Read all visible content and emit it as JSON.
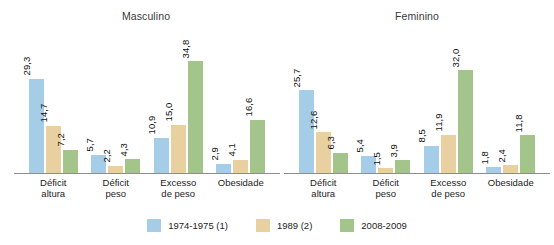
{
  "chart_data": {
    "type": "bar",
    "title": "",
    "xlabel": "",
    "ylabel": "",
    "ylim": [
      0,
      34.8
    ],
    "grid": false,
    "legend_position": "bottom",
    "panels": [
      {
        "title": "Masculino",
        "categories": [
          "Déficit\naltura",
          "Déficit\npeso",
          "Excesso\nde peso",
          "Obesidade"
        ],
        "series": [
          {
            "name": "1974-1975 (1)",
            "color": "#a6cde8",
            "values": [
              29.3,
              5.7,
              10.9,
              2.9
            ],
            "labels": [
              "29,3",
              "5,7",
              "10,9",
              "2,9"
            ]
          },
          {
            "name": "1989 (2)",
            "color": "#e9d0a0",
            "values": [
              14.7,
              2.2,
              15.0,
              4.1
            ],
            "labels": [
              "14,7",
              "2,2",
              "15,0",
              "4,1"
            ]
          },
          {
            "name": "2008-2009",
            "color": "#a3c48a",
            "values": [
              7.2,
              4.3,
              34.8,
              16.6
            ],
            "labels": [
              "7,2",
              "4,3",
              "34,8",
              "16,6"
            ]
          }
        ]
      },
      {
        "title": "Feminino",
        "categories": [
          "Déficit\naltura",
          "Déficit\npeso",
          "Excesso\nde peso",
          "Obesidade"
        ],
        "series": [
          {
            "name": "1974-1975 (1)",
            "color": "#a6cde8",
            "values": [
              25.7,
              5.4,
              8.5,
              1.8
            ],
            "labels": [
              "25,7",
              "5,4",
              "8,5",
              "1,8"
            ]
          },
          {
            "name": "1989 (2)",
            "color": "#e9d0a0",
            "values": [
              12.6,
              1.5,
              11.9,
              2.4
            ],
            "labels": [
              "12,6",
              "1,5",
              "11,9",
              "2,4"
            ]
          },
          {
            "name": "2008-2009",
            "color": "#a3c48a",
            "values": [
              6.3,
              3.9,
              32.0,
              11.8
            ],
            "labels": [
              "6,3",
              "3,9",
              "32,0",
              "11,8"
            ]
          }
        ]
      }
    ],
    "legend": [
      {
        "label": "1974-1975 (1)",
        "color": "#a6cde8"
      },
      {
        "label": "1989 (2)",
        "color": "#e9d0a0"
      },
      {
        "label": "2008-2009",
        "color": "#a3c48a"
      }
    ]
  }
}
